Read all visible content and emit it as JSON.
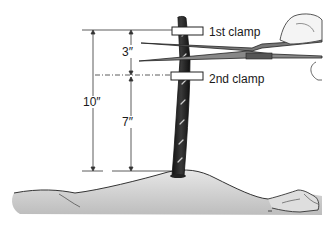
{
  "diagram": {
    "labels": {
      "first_clamp": "1st clamp",
      "second_clamp": "2nd clamp"
    },
    "dimensions": {
      "total": "10″",
      "between_clamps": "3″",
      "second_clamp_to_body": "7″"
    },
    "colors": {
      "ink": "#1a1a1a",
      "cord": "#2b2b2b",
      "body_fill": "#dcdcdc",
      "clamp_fill": "#ffffff"
    }
  }
}
